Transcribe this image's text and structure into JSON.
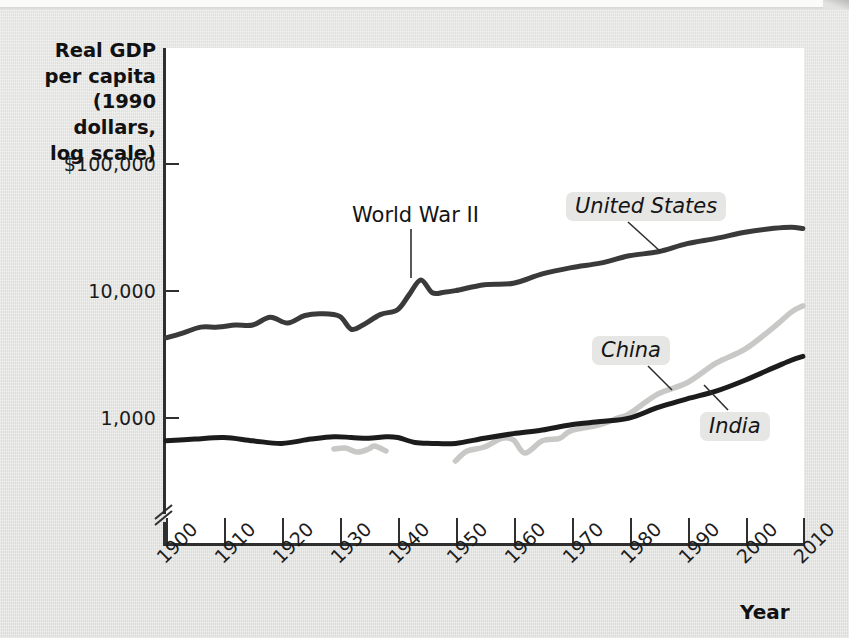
{
  "figure": {
    "background_color": "#e3e3e1",
    "plot_background_color": "#ffffff",
    "axis_color": "#2f2f2f"
  },
  "axes": {
    "y_title_lines": [
      "Real GDP",
      "per capita",
      "(1990 dollars,",
      "log scale)"
    ],
    "y_ticks": [
      {
        "label": "$100,000",
        "value": 100000
      },
      {
        "label": "10,000",
        "value": 10000
      },
      {
        "label": "1,000",
        "value": 1000
      }
    ],
    "y_axis_break": true,
    "x_title": "Year",
    "x_ticks": [
      "1900",
      "1910",
      "1920",
      "1930",
      "1940",
      "1950",
      "1960",
      "1970",
      "1980",
      "1990",
      "2000",
      "2010"
    ]
  },
  "annotations": [
    {
      "name": "world-war-ii",
      "text": "World War II",
      "italic": false,
      "boxed": false
    },
    {
      "name": "united-states",
      "text": "United States",
      "italic": true,
      "boxed": true
    },
    {
      "name": "china",
      "text": "China",
      "italic": true,
      "boxed": true
    },
    {
      "name": "india",
      "text": "India",
      "italic": true,
      "boxed": true
    }
  ],
  "chart_data": {
    "type": "line",
    "title": "",
    "xlabel": "Year",
    "ylabel": "Real GDP per capita (1990 dollars, log scale)",
    "xlim": [
      1900,
      2010
    ],
    "ylim": [
      400,
      100000
    ],
    "yscale": "log",
    "y_axis_break": true,
    "grid": false,
    "legend": "inline-labels",
    "series": [
      {
        "name": "United States",
        "color": "#3a3a3a",
        "x": [
          1900,
          1903,
          1906,
          1909,
          1912,
          1915,
          1918,
          1921,
          1924,
          1927,
          1930,
          1932,
          1934,
          1937,
          1940,
          1942,
          1944,
          1946,
          1948,
          1950,
          1955,
          1960,
          1965,
          1970,
          1975,
          1980,
          1985,
          1990,
          1995,
          2000,
          2005,
          2008,
          2010
        ],
        "y": [
          4200,
          4600,
          5100,
          5100,
          5300,
          5300,
          6100,
          5500,
          6300,
          6500,
          6200,
          4900,
          5300,
          6400,
          7000,
          9200,
          12000,
          9500,
          9600,
          9900,
          11000,
          11300,
          13400,
          15000,
          16300,
          18600,
          20000,
          23200,
          25500,
          28500,
          30600,
          31200,
          30500
        ],
        "label_point": [
          1978,
          19000
        ]
      },
      {
        "name": "China",
        "color": "#c8c8c6",
        "segments": [
          {
            "x": [
              1929,
              1931,
              1933,
              1935,
              1936,
              1938
            ],
            "y": [
              560,
              570,
              530,
              560,
              590,
              540
            ]
          },
          {
            "x": [
              1950,
              1952,
              1955,
              1958,
              1960,
              1962,
              1965,
              1968,
              1970,
              1975,
              1978,
              1980,
              1985,
              1990,
              1995,
              2000,
              2005,
              2008,
              2010
            ],
            "y": [
              450,
              540,
              580,
              680,
              660,
              520,
              650,
              680,
              780,
              870,
              980,
              1060,
              1520,
              1860,
              2650,
              3420,
              5100,
              6700,
              7500
            ]
          }
        ],
        "label_point": [
          1983,
          1380
        ]
      },
      {
        "name": "India",
        "color": "#1c1c1c",
        "x": [
          1900,
          1905,
          1910,
          1915,
          1920,
          1925,
          1929,
          1932,
          1935,
          1938,
          1940,
          1943,
          1946,
          1950,
          1955,
          1960,
          1965,
          1970,
          1975,
          1980,
          1985,
          1990,
          1995,
          2000,
          2005,
          2008,
          2010
        ],
        "y": [
          650,
          670,
          690,
          650,
          620,
          670,
          700,
          690,
          680,
          700,
          690,
          630,
          620,
          620,
          680,
          740,
          790,
          870,
          920,
          980,
          1190,
          1390,
          1600,
          1950,
          2450,
          2800,
          3000
        ],
        "label_point": [
          1992,
          1350
        ]
      }
    ],
    "annotations": [
      {
        "text": "World War II",
        "x": 1944,
        "y": 12000,
        "points_to_series": "United States"
      }
    ]
  }
}
